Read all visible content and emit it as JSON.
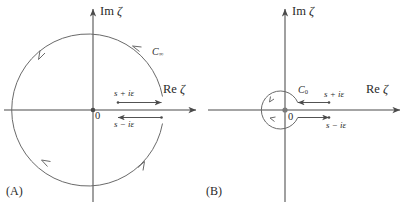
{
  "figure": {
    "background": "#ffffff",
    "stroke_color": "#4a4a4a",
    "text_color": "#2a2a2a"
  },
  "panels": [
    {
      "tag": "(A)",
      "name": "panel-a-large-contour",
      "axes": {
        "imaginary_label_prefix": "Im",
        "real_label_prefix": "Re",
        "variable_symbol": "ζ",
        "origin_label": "0"
      },
      "contour": {
        "name": "C",
        "subscript": "∞",
        "full_label": "C∞",
        "shape": "circle",
        "orientation": "counter-clockwise",
        "radius_px": 76,
        "arrowhead_count": 4
      },
      "branch_cut_paths": [
        {
          "label": "s + iε",
          "label_plain": "s+iε",
          "side": "above-axis",
          "arrow_direction": "right"
        },
        {
          "label": "s − iε",
          "label_plain": "s-iε",
          "side": "below-axis",
          "arrow_direction": "left"
        }
      ]
    },
    {
      "tag": "(B)",
      "name": "panel-b-small-contour",
      "axes": {
        "imaginary_label_prefix": "Im",
        "real_label_prefix": "Re",
        "variable_symbol": "ζ",
        "origin_label": "0"
      },
      "contour": {
        "name": "C",
        "subscript": "0",
        "full_label": "C0",
        "shape": "circle",
        "orientation": "counter-clockwise",
        "radius_px": 19,
        "arrowhead_count": 2
      },
      "branch_cut_paths": [
        {
          "label": "s + iε",
          "label_plain": "s+iε",
          "side": "above-axis",
          "arrow_direction": "left"
        },
        {
          "label": "s − iε",
          "label_plain": "s-iε",
          "side": "below-axis",
          "arrow_direction": "right"
        }
      ]
    }
  ]
}
